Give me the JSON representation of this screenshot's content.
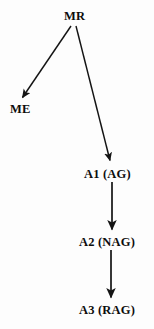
{
  "diagram": {
    "type": "directed-tree",
    "background_color": "#fdfdfd",
    "stroke_color": "#141414",
    "text_color": "#0d0d0d",
    "nodes": [
      {
        "id": "MR",
        "label": "MR",
        "x": 76,
        "y": 16
      },
      {
        "id": "ME",
        "label": "ME",
        "x": 22,
        "y": 109
      },
      {
        "id": "A1",
        "label": "A1 (AG)",
        "x": 112,
        "y": 174
      },
      {
        "id": "A2",
        "label": "A2 (NAG)",
        "x": 113,
        "y": 242
      },
      {
        "id": "A3",
        "label": "A3 (RAG)",
        "x": 113,
        "y": 310
      }
    ],
    "edges": [
      {
        "id": "mr-to-me",
        "from": "MR",
        "to": "ME",
        "x1": 71,
        "y1": 26,
        "x2": 21,
        "y2": 100,
        "arrowhead": true
      },
      {
        "id": "mr-to-a1",
        "from": "MR",
        "to": "A1",
        "x1": 76,
        "y1": 26,
        "x2": 111,
        "y2": 163,
        "arrowhead": true
      },
      {
        "id": "a1-to-a2",
        "from": "A1",
        "to": "A2",
        "x1": 112,
        "y1": 182,
        "x2": 112,
        "y2": 232,
        "arrowhead": true
      },
      {
        "id": "a2-to-a3",
        "from": "A2",
        "to": "A3",
        "x1": 111,
        "y1": 250,
        "x2": 111,
        "y2": 300,
        "arrowhead": true
      }
    ]
  }
}
